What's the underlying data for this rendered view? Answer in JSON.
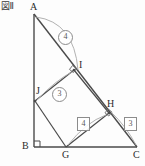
{
  "figure": {
    "caption": "図Ⅱ",
    "stroke_color": "#4a4a4a",
    "arc_color": "#9a9a9a",
    "label_color": "#2b2b2b"
  },
  "vertices": [
    {
      "id": "A",
      "label": "A",
      "x": 34,
      "y": 14,
      "lx": 30,
      "ly": 2
    },
    {
      "id": "B",
      "label": "B",
      "x": 34,
      "y": 147,
      "lx": 22,
      "ly": 142
    },
    {
      "id": "C",
      "label": "C",
      "x": 137,
      "y": 147,
      "lx": 134,
      "ly": 150
    },
    {
      "id": "G",
      "label": "G",
      "x": 66,
      "y": 147,
      "lx": 62,
      "ly": 150
    },
    {
      "id": "H",
      "label": "H",
      "x": 109,
      "y": 113,
      "lx": 108,
      "ly": 101
    },
    {
      "id": "I",
      "label": "I",
      "x": 74,
      "y": 70,
      "lx": 78,
      "ly": 62
    },
    {
      "id": "J",
      "label": "J",
      "x": 35,
      "y": 101,
      "lx": 37,
      "ly": 88
    }
  ],
  "segments": [
    {
      "name": "side-AB",
      "from": "A",
      "to": "B"
    },
    {
      "name": "side-BC",
      "from": "B",
      "to": "C"
    },
    {
      "name": "side-AC",
      "from": "A",
      "to": "C"
    },
    {
      "name": "segment-JI",
      "from": "J",
      "to": "I"
    },
    {
      "name": "segment-IH",
      "from": "I",
      "to": "H"
    },
    {
      "name": "segment-HG",
      "from": "H",
      "to": "G"
    },
    {
      "name": "segment-GJ",
      "from": "G",
      "to": "J"
    },
    {
      "name": "segment-GH-to-C",
      "from": "G",
      "to": "H"
    }
  ],
  "right_angle_marks": [
    {
      "name": "right-angle-B",
      "x": 35,
      "y": 140
    },
    {
      "name": "right-angle-I",
      "x": 71,
      "y": 67
    },
    {
      "name": "right-angle-H",
      "x": 106,
      "y": 110
    }
  ],
  "annotations": [
    {
      "name": "ratio-circle-4",
      "style": "circle",
      "value": "④",
      "text": "4",
      "x": 58,
      "y": 30,
      "arc": "M 36,17 Q 74,22 78,70"
    },
    {
      "name": "ratio-circle-3",
      "style": "circle",
      "value": "③",
      "text": "3",
      "x": 52,
      "y": 87,
      "arc": "M 72,72 Q 56,80 37,100"
    },
    {
      "name": "ratio-box-4",
      "style": "box",
      "value": "4",
      "text": "4",
      "x": 77,
      "y": 117,
      "arc": "M 106,115 Q 86,122 68,145"
    },
    {
      "name": "ratio-box-3",
      "style": "box",
      "value": "3",
      "text": "3",
      "x": 124,
      "y": 117,
      "arc": "M 111,112 Q 124,126 136,145"
    }
  ]
}
